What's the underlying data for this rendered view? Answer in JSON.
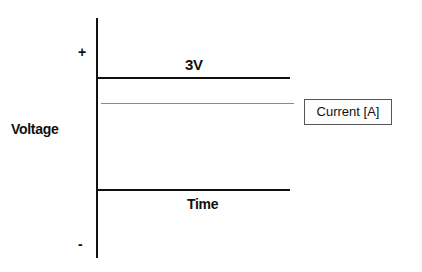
{
  "diagram": {
    "y_axis": {
      "label": "Voltage",
      "positive_marker": "+",
      "negative_marker": "-"
    },
    "x_axis": {
      "label": "Time"
    },
    "voltage_line": {
      "label": "3V"
    },
    "current_line": {
      "style": "dotted",
      "legend_label": "Current [A]"
    },
    "colors": {
      "axis": "#111111",
      "current_line": "#8a8a8a",
      "legend_border": "#555555"
    }
  }
}
